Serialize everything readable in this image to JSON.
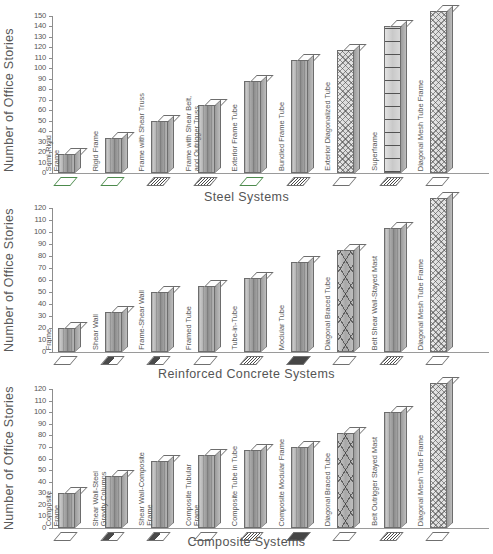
{
  "figure": {
    "y_axis_label": "Number of Office Stories",
    "panels": [
      "steel",
      "reinforced_concrete",
      "composite"
    ]
  },
  "chart_data": [
    {
      "type": "bar",
      "title": "",
      "xlabel": "Steel Systems",
      "ylabel": "Number of Office Stories",
      "ylim": [
        0,
        150
      ],
      "ytick_step": 10,
      "yticks": [
        0,
        10,
        20,
        30,
        40,
        50,
        60,
        70,
        80,
        90,
        100,
        110,
        120,
        130,
        140,
        150
      ],
      "grid": false,
      "legend": "none",
      "categories": [
        "Semi-Rigid\nFrame",
        "Rigid Frame",
        "Frame with Shear Truss",
        "Frame with Shear Belt,\nand Outrigger Truss",
        "Exterior Frame Tube",
        "Bundled Frame Tube",
        "Exterior Diagonalized Tube",
        "Superframe",
        "Diagonal Mesh Tube Frame"
      ],
      "values": [
        18,
        33,
        50,
        65,
        88,
        108,
        118,
        140,
        155
      ],
      "styles": [
        "solid",
        "solid",
        "solid",
        "solid",
        "solid",
        "solid",
        "mesh",
        "frame",
        "mesh"
      ],
      "plan_icons": [
        "outline-green",
        "outline-green",
        "grid",
        "grid",
        "outline-green",
        "grid",
        "outline",
        "grid",
        "outline"
      ]
    },
    {
      "type": "bar",
      "title": "",
      "xlabel": "Reinforced Concrete Systems",
      "ylabel": "Number of Office Stories",
      "ylim": [
        0,
        120
      ],
      "ytick_step": 10,
      "yticks": [
        0,
        10,
        20,
        30,
        40,
        50,
        60,
        70,
        80,
        90,
        100,
        110,
        120
      ],
      "grid": false,
      "legend": "none",
      "categories": [
        "Frame",
        "Shear Wall",
        "Frame-Shear Wall",
        "Framed Tube",
        "Tube-in-Tube",
        "Modular Tube",
        "Diagonal Braced Tube",
        "Belt Shear Wall-Stayed Mast",
        "Diagonal Mesh Tube Frame"
      ],
      "values": [
        20,
        33,
        50,
        55,
        62,
        75,
        85,
        103,
        128
      ],
      "styles": [
        "solid",
        "solid",
        "solid",
        "solid",
        "solid",
        "solid",
        "diag",
        "solid",
        "mesh"
      ],
      "plan_icons": [
        "outline",
        "half",
        "half",
        "outline",
        "grid",
        "filled",
        "outline",
        "grid",
        "outline"
      ]
    },
    {
      "type": "bar",
      "title": "",
      "xlabel": "Composite Systems",
      "ylabel": "Number of Office Stories",
      "ylim": [
        0,
        120
      ],
      "ytick_step": 10,
      "yticks": [
        0,
        10,
        20,
        30,
        40,
        50,
        60,
        70,
        80,
        90,
        100,
        110,
        120
      ],
      "grid": false,
      "legend": "none",
      "categories": [
        "Composite\nFrame",
        "Shear Wall-Steel\nGravity Columns",
        "Shear Wall-Composite\nFrame",
        "Composite Tubular\nFrame",
        "Composite Tube in Tube",
        "Composite Modular Frame",
        "Diagonal Braced Tube",
        "Belt Outrigger Stayed Mast",
        "Diagonal Mesh Tube Frame"
      ],
      "values": [
        30,
        45,
        58,
        63,
        67,
        70,
        82,
        100,
        125
      ],
      "styles": [
        "solid",
        "solid",
        "solid",
        "solid",
        "solid",
        "solid",
        "diag",
        "solid",
        "mesh"
      ],
      "plan_icons": [
        "outline",
        "half",
        "half",
        "outline",
        "grid",
        "filled",
        "outline",
        "grid",
        "outline"
      ]
    }
  ],
  "colors": {
    "axis": "#8d8d8d",
    "text": "#555555",
    "bar_face": "#a6a6a6",
    "bar_top": "#fdfdfd",
    "background": "#ffffff"
  }
}
